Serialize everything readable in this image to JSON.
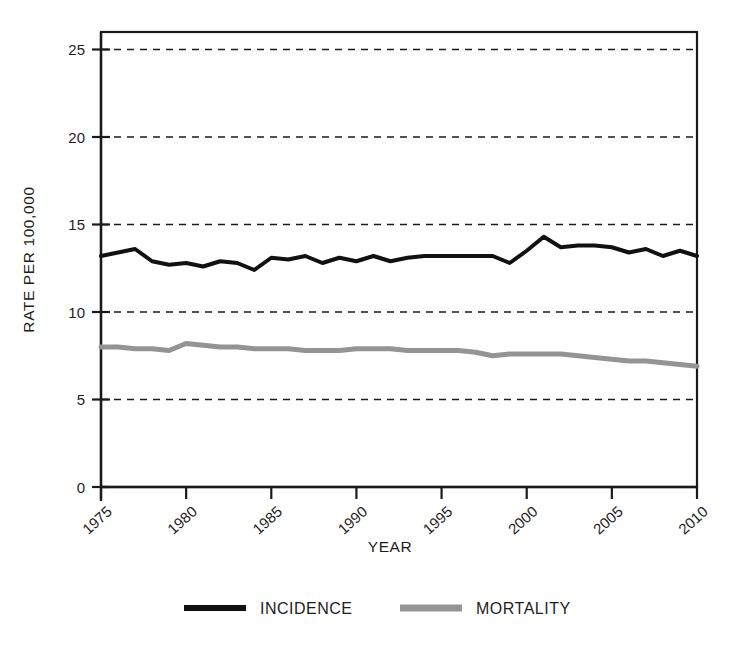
{
  "figure": {
    "background_color": "#ffffff",
    "plot_border_color": "#1a1a1a",
    "gridline_color": "#1a1a1a"
  },
  "axis": {
    "y_title": "RATE PER 100,000",
    "x_title": "YEAR",
    "y_ticks": [
      "0",
      "5",
      "10",
      "15",
      "20",
      "25"
    ],
    "x_ticks": [
      "1975",
      "1980",
      "1985",
      "1990",
      "1995",
      "2000",
      "2005",
      "2010"
    ]
  },
  "legend": {
    "items": [
      {
        "label": "INCIDENCE",
        "color": "#111111",
        "swatch": "line-swatch-incidence"
      },
      {
        "label": "MORTALITY",
        "color": "#949494",
        "swatch": "line-swatch-mortality"
      }
    ]
  },
  "chart_data": {
    "type": "line",
    "title": "",
    "subtitle": "",
    "xlabel": "YEAR",
    "ylabel": "RATE PER 100,000",
    "xlim": [
      1975,
      2010
    ],
    "ylim": [
      0,
      26
    ],
    "ytick_values": [
      0,
      5,
      10,
      15,
      20,
      25
    ],
    "xtick_values": [
      1975,
      1980,
      1985,
      1990,
      1995,
      2000,
      2005,
      2010
    ],
    "grid": "horizontal-dashed",
    "legend_position": "below-plot",
    "x": [
      1975,
      1976,
      1977,
      1978,
      1979,
      1980,
      1981,
      1982,
      1983,
      1984,
      1985,
      1986,
      1987,
      1988,
      1989,
      1990,
      1991,
      1992,
      1993,
      1994,
      1995,
      1996,
      1997,
      1998,
      1999,
      2000,
      2001,
      2002,
      2003,
      2004,
      2005,
      2006,
      2007,
      2008,
      2009,
      2010
    ],
    "series": [
      {
        "name": "INCIDENCE",
        "color": "#111111",
        "line_width": 4,
        "values": [
          13.2,
          13.4,
          13.6,
          12.9,
          12.7,
          12.8,
          12.6,
          12.9,
          12.8,
          12.4,
          13.1,
          13.0,
          13.2,
          12.8,
          13.1,
          12.9,
          13.2,
          12.9,
          13.1,
          13.2,
          13.2,
          13.2,
          13.2,
          13.2,
          12.8,
          13.5,
          14.3,
          13.7,
          13.8,
          13.8,
          13.7,
          13.4,
          13.6,
          13.2,
          13.5,
          13.2
        ]
      },
      {
        "name": "MORTALITY",
        "color": "#949494",
        "line_width": 5,
        "values": [
          8.0,
          8.0,
          7.9,
          7.9,
          7.8,
          8.2,
          8.1,
          8.0,
          8.0,
          7.9,
          7.9,
          7.9,
          7.8,
          7.8,
          7.8,
          7.9,
          7.9,
          7.9,
          7.8,
          7.8,
          7.8,
          7.8,
          7.7,
          7.5,
          7.6,
          7.6,
          7.6,
          7.6,
          7.5,
          7.4,
          7.3,
          7.2,
          7.2,
          7.1,
          7.0,
          6.9
        ]
      }
    ]
  }
}
